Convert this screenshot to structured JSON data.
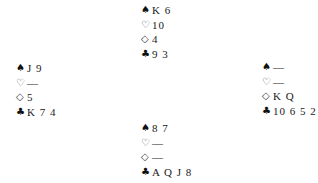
{
  "diagram": {
    "type": "bridge-deal",
    "suit_symbols": {
      "spades": "♠",
      "hearts": "♡",
      "diamonds": "◇",
      "clubs": "♣"
    },
    "hands": {
      "north": {
        "spades": "K 6",
        "hearts": "10",
        "diamonds": "4",
        "clubs": "9 3"
      },
      "west": {
        "spades": "J 9",
        "hearts": "—",
        "diamonds": "5",
        "clubs": "K 7 4"
      },
      "east": {
        "spades": "—",
        "hearts": "—",
        "diamonds": "K Q",
        "clubs": "10 6 5 2"
      },
      "south": {
        "spades": "8 7",
        "hearts": "—",
        "diamonds": "—",
        "clubs": "A Q J 8"
      }
    }
  }
}
